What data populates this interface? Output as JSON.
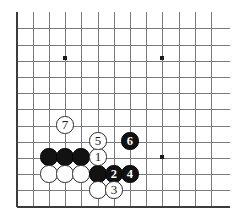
{
  "figure": {
    "kind": "go-board-diagram",
    "board_size": 19,
    "visible_region": "bottom-left corner section",
    "background_color": "#ffffff",
    "line_color": "#7a7a7a",
    "edge_color": "#3c3c3c",
    "black_color": "#121212",
    "white_color": "#ffffff"
  },
  "geometry": {
    "left_edge_x": 17,
    "bottom_edge_y": 207,
    "top_y": 12,
    "right_x": 230,
    "spacing": 16.2,
    "cols": 13,
    "rows": 12,
    "stone_radius": 8.6
  },
  "star_points": [
    {
      "name": "star-point-upper-left",
      "x": 65,
      "y": 58
    },
    {
      "name": "star-point-upper-right",
      "x": 162,
      "y": 58
    },
    {
      "name": "star-point-lower-right",
      "x": 162,
      "y": 157
    }
  ],
  "stones": [
    {
      "id": "black-a",
      "color": "black",
      "label": "",
      "x": 49,
      "y": 157
    },
    {
      "id": "black-b",
      "color": "black",
      "label": "",
      "x": 65,
      "y": 157
    },
    {
      "id": "black-c",
      "color": "black",
      "label": "",
      "x": 81,
      "y": 157
    },
    {
      "id": "white-a",
      "color": "white",
      "label": "",
      "x": 49,
      "y": 174
    },
    {
      "id": "white-b",
      "color": "white",
      "label": "",
      "x": 65,
      "y": 174
    },
    {
      "id": "white-c",
      "color": "white",
      "label": "",
      "x": 81,
      "y": 174
    },
    {
      "id": "black-d",
      "color": "black",
      "label": "",
      "x": 98,
      "y": 174
    },
    {
      "id": "white-d",
      "color": "white",
      "label": "",
      "x": 98,
      "y": 190
    },
    {
      "id": "move-1",
      "color": "white",
      "label": "1",
      "x": 98,
      "y": 157
    },
    {
      "id": "move-2",
      "color": "black",
      "label": "2",
      "x": 114,
      "y": 174
    },
    {
      "id": "move-3",
      "color": "white",
      "label": "3",
      "x": 114,
      "y": 190
    },
    {
      "id": "move-4",
      "color": "black",
      "label": "4",
      "x": 130,
      "y": 174
    },
    {
      "id": "move-5",
      "color": "white",
      "label": "5",
      "x": 98,
      "y": 141
    },
    {
      "id": "move-6",
      "color": "black",
      "label": "6",
      "x": 130,
      "y": 141
    },
    {
      "id": "move-7",
      "color": "white",
      "label": "7",
      "x": 65,
      "y": 125
    }
  ]
}
